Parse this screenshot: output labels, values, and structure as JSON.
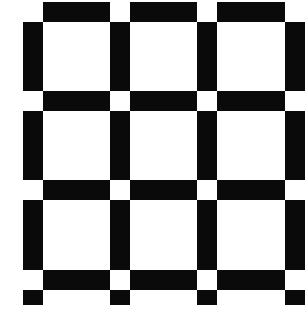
{
  "figure": {
    "colors": {
      "bar": "#0a0a0a",
      "background": "#ffffff",
      "intersection": "#ffffff"
    },
    "columns_px": [
      [
        23,
        43
      ],
      [
        110,
        130
      ],
      [
        197,
        217
      ],
      [
        285,
        305
      ]
    ],
    "rows_px": [
      [
        2,
        22
      ],
      [
        91,
        111
      ],
      [
        180,
        200
      ],
      [
        270,
        290
      ]
    ],
    "bottom_strip_px": [
      290,
      305
    ],
    "cells": 9
  }
}
